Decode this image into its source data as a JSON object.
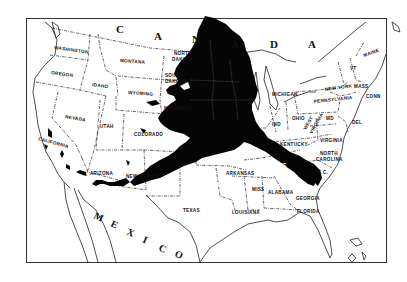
{
  "map": {
    "title": "Alaska superimposed on the contiguous United States",
    "colors": {
      "background": "#ffffff",
      "overlay": "#050505",
      "lines": "#222222"
    },
    "countries": {
      "canada": [
        "C",
        "A",
        "N",
        "A",
        "D",
        "A"
      ],
      "mexico": [
        "M",
        "E",
        "X",
        "I",
        "C",
        "O"
      ]
    },
    "states": {
      "washington": "WASHINGTON",
      "oregon": "OREGON",
      "california": "CALIFORNIA",
      "idaho": "IDAHO",
      "nevada": "NEVADA",
      "montana": "MONTANA",
      "wyoming": "WYOMING",
      "utah": "UTAH",
      "arizona": "ARIZONA",
      "colorado": "COLORADO",
      "new_mexico": "NEW MEXICO",
      "north_dakota_1": "NORTH",
      "north_dakota_2": "DAKOTA",
      "south_dakota_1": "SOUTH",
      "south_dakota_2": "DAKOTA",
      "nebraska": "NEBRASKA",
      "texas": "TEXAS",
      "oklahoma": "OKLAHOMA",
      "missouri": "MISSOURI",
      "arkansas": "ARKANSAS",
      "louisiana": "LOUISIANA",
      "mississippi": "MISS",
      "alabama": "ALABAMA",
      "georgia": "GEORGIA",
      "florida": "FLORIDA",
      "tennessee": "TENNESSEE",
      "kentucky": "KENTUCKY",
      "north_carolina_1": "NORTH",
      "north_carolina_2": "CAROLINA",
      "south_carolina": "S.C.",
      "virginia": "VIRGINIA",
      "west_virginia_1": "WEST",
      "west_virginia_2": "VIRGINIA",
      "maryland": "MD",
      "delaware": "DEL",
      "pennsylvania": "PENNSYLVANIA",
      "new_york": "NEW YORK",
      "ohio": "OHIO",
      "indiana": "IND",
      "michigan": "MICHIGAN",
      "maine": "MAINE",
      "vermont": "VT",
      "massachusetts": "MASS",
      "connecticut": "CONN"
    }
  }
}
